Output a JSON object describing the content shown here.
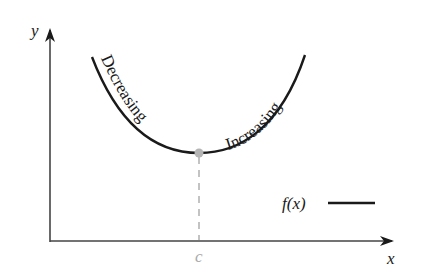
{
  "figure": {
    "axes": {
      "x_label": "x",
      "y_label": "y"
    },
    "curve": {
      "left_label": "Decreasing",
      "right_label": "Increasing",
      "color": "#1a1a1a"
    },
    "critical_point": {
      "label": "c",
      "color": "#aaaaaa"
    },
    "legend": {
      "label": "f(x)",
      "line_color": "#1a1a1a"
    }
  }
}
